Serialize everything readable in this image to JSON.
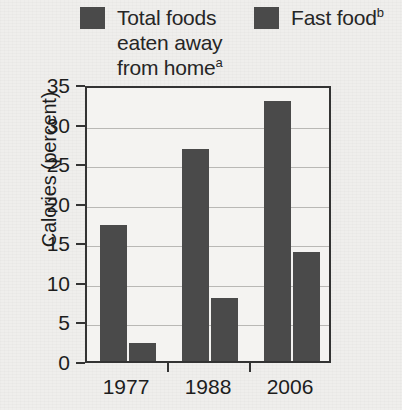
{
  "chart_data": {
    "type": "bar",
    "title": "",
    "subtitle": "",
    "xlabel": "",
    "ylabel": "Calories (percent)",
    "categories": [
      "1977",
      "1988",
      "2006"
    ],
    "series": [
      {
        "name": "Total foods eaten away from home",
        "note_marker": "a",
        "color": "#4a4a4a",
        "values": [
          17.2,
          26.8,
          32.8
        ]
      },
      {
        "name": "Fast food",
        "note_marker": "b",
        "color": "#4a4a4a",
        "values": [
          2.3,
          8.0,
          13.8
        ]
      }
    ],
    "ylim": [
      0,
      35
    ],
    "ytick_values": [
      0,
      5,
      10,
      15,
      20,
      25,
      30,
      35
    ],
    "ytick_labels": [
      "0",
      "5",
      "10",
      "15",
      "20",
      "25",
      "30",
      "35"
    ],
    "grid": true,
    "grid_axis": "y",
    "legend_position": "top",
    "frame": true
  },
  "legend": {
    "entries": [
      {
        "label": "Total foods\neaten away\nfrom home",
        "marker": "a",
        "swatch_color": "#4a4a4a"
      },
      {
        "label": "Fast food",
        "marker": "b",
        "swatch_color": "#4a4a4a"
      }
    ]
  },
  "axes": {
    "y_title": "Calories (percent)",
    "y_ticks": [
      "0",
      "5",
      "10",
      "15",
      "20",
      "25",
      "30",
      "35"
    ],
    "x_ticks": [
      "1977",
      "1988",
      "2006"
    ]
  },
  "style": {
    "background": "#efeeec",
    "plot_background": "#f4f3f1",
    "bar_color": "#4a4a4a",
    "axis_color": "#333333",
    "grid_color": "#b9b8b5",
    "text_color": "#1d1d1d"
  }
}
